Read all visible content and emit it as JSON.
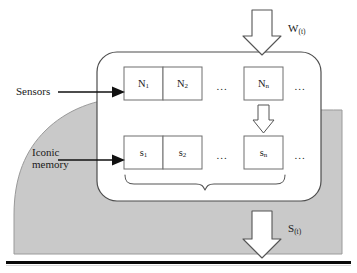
{
  "diagram": {
    "colors": {
      "environment_fill": "#c9c9c9",
      "environment_stroke": "#8f8f8f",
      "buffer_fill": "#ffffff",
      "buffer_stroke": "#4a4a4a",
      "cell_stroke": "#6e6e6e",
      "arrow_fill": "#ffffff",
      "arrow_stroke": "#555555",
      "pointer_arrow": "#111111",
      "baseline": "#000000",
      "text": "#1a1a1a"
    },
    "side_labels": [
      {
        "name": "sensors",
        "text": "Sensors"
      },
      {
        "name": "iconic-memory",
        "line1": "Iconic",
        "line2": "memory"
      }
    ],
    "flow_labels": [
      {
        "name": "world-input",
        "symbol": "W",
        "subscript": "(t)"
      },
      {
        "name": "sensation-output",
        "symbol": "S",
        "subscript": "(t)"
      }
    ],
    "sensor_row": {
      "name": "sensor-cells",
      "cells": [
        {
          "symbol": "N",
          "subscript": "1"
        },
        {
          "symbol": "N",
          "subscript": "2"
        },
        {
          "symbol": "N",
          "subscript": "n"
        }
      ],
      "ellipsis_mid": "...",
      "ellipsis_end": "..."
    },
    "memory_row": {
      "name": "memory-cells",
      "cells": [
        {
          "symbol": "s",
          "subscript": "1"
        },
        {
          "symbol": "s",
          "subscript": "2"
        },
        {
          "symbol": "s",
          "subscript": "n"
        }
      ],
      "ellipsis_mid": "...",
      "ellipsis_end": "..."
    },
    "connectors": [
      {
        "name": "transduction-arrow",
        "from": "N_n",
        "to": "s_n"
      },
      {
        "name": "aggregation-brace",
        "spans": "memory-cells"
      }
    ]
  }
}
